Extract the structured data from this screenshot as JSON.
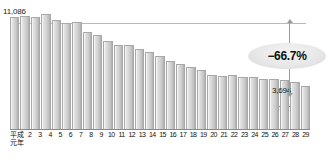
{
  "chart_data": {
    "type": "bar",
    "title": "",
    "xlabel": "",
    "ylabel": "",
    "ylim": [
      0,
      11086
    ],
    "grid": false,
    "legend": null,
    "categories": [
      "元年",
      "2",
      "3",
      "4",
      "5",
      "6",
      "7",
      "8",
      "9",
      "10",
      "11",
      "12",
      "13",
      "14",
      "15",
      "16",
      "17",
      "18",
      "19",
      "20",
      "21",
      "22",
      "23",
      "24",
      "25",
      "26",
      "27",
      "28",
      "29"
    ],
    "values": [
      11086,
      11200,
      11100,
      11451,
      10800,
      10450,
      10600,
      9550,
      9200,
      8500,
      8150,
      8100,
      7700,
      7300,
      6900,
      6400,
      6050,
      5750,
      5400,
      4850,
      4800,
      4900,
      4700,
      4600,
      4450,
      4400,
      4350,
      4150,
      3694
    ],
    "annotations": [
      {
        "name": "peak-value-label",
        "text": "11,086"
      },
      {
        "name": "final-value-label",
        "text": "3,694"
      },
      {
        "name": "change-badge",
        "text": "−66.7%"
      }
    ],
    "era_label": {
      "line1": "平成",
      "line2": "元年"
    }
  },
  "colors": {
    "bar_light": "#e2e2e2",
    "bar_dark": "#ababab",
    "bar_border": "#a8a8a8",
    "axis": "#8a8a8a",
    "reference_line": "#b9b9b9",
    "arrow": "#9a9a9a",
    "badge_fill": "#e8e8e8",
    "text": "#101010"
  }
}
